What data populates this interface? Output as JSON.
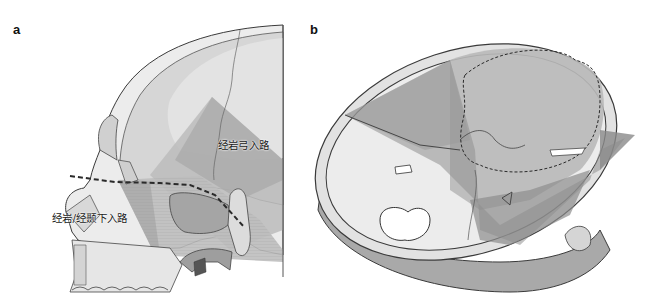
{
  "figure": {
    "panels": [
      {
        "id": "a",
        "letter": "a",
        "view": "sagittal skull section",
        "labels": {
          "upper_approach": "经岩弓入路",
          "lower_approach": "经岩/经颞下入路"
        }
      },
      {
        "id": "b",
        "letter": "b",
        "view": "oblique view of cranial base"
      }
    ],
    "colors": {
      "bone_fill": "#e6e6e6",
      "bone_outline": "#3a3a3a",
      "corridor_light": "#cfcfcf",
      "corridor_dark": "#8c8c8c",
      "inner_skull": "#d9d9d9",
      "dashed_line": "#2a2a2a",
      "background": "#ffffff"
    }
  }
}
